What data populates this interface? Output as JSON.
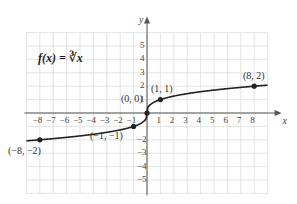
{
  "chart_data": {
    "type": "line",
    "title": "f(x) = ∛x",
    "function_label": "f(x) = ∛x",
    "xlabel": "x",
    "ylabel": "y",
    "xlim": [
      -9,
      9
    ],
    "ylim": [
      -6,
      6
    ],
    "grid": true,
    "x_ticks": [
      -8,
      -7,
      -6,
      -5,
      -4,
      -3,
      -2,
      -1,
      1,
      2,
      3,
      4,
      5,
      6,
      7,
      8
    ],
    "y_ticks": [
      -5,
      -4,
      -3,
      -2,
      -1,
      1,
      2,
      3,
      4,
      5
    ],
    "x_tick_labels": [
      "−8",
      "−7",
      "−6",
      "−5",
      "−4",
      "−3",
      "−2",
      "−1",
      "1",
      "2",
      "3",
      "4",
      "5",
      "6",
      "7",
      "8"
    ],
    "y_tick_labels": [
      "−5",
      "−4",
      "−3",
      "−2",
      "1",
      "2",
      "3",
      "4",
      "5"
    ],
    "series": [
      {
        "name": "f(x) = ∛x",
        "x_range": [
          -9,
          9
        ],
        "formula": "cbrt(x)"
      }
    ],
    "points": [
      {
        "x": -8,
        "y": -2,
        "label": "(−8, −2)"
      },
      {
        "x": -1,
        "y": -1,
        "label": "(−1, −1)"
      },
      {
        "x": 0,
        "y": 0,
        "label": "(0, 0)"
      },
      {
        "x": 1,
        "y": 1,
        "label": "(1, 1)"
      },
      {
        "x": 8,
        "y": 2,
        "label": "(8, 2)"
      }
    ],
    "colors": {
      "curve": "#222222",
      "grid": "#dddddd",
      "axis": "#555555",
      "text": "#333333"
    }
  }
}
